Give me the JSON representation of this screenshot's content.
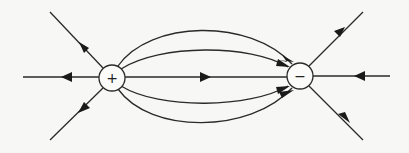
{
  "diagram": {
    "colors": {
      "line": "#2a2a2a",
      "background": "#f7f7f5",
      "charge_fill": "#fbfbfa"
    },
    "charges": [
      {
        "id": "positive",
        "label": "+",
        "cx": 112,
        "cy": 78,
        "r": 13
      },
      {
        "id": "negative",
        "label": "−",
        "cx": 300,
        "cy": 76,
        "r": 13
      }
    ],
    "field_lines": [
      {
        "id": "left-upper",
        "direction": "away-from-positive"
      },
      {
        "id": "left-horizontal",
        "direction": "away-from-positive"
      },
      {
        "id": "left-lower",
        "direction": "away-from-positive"
      },
      {
        "id": "arc-outer-top",
        "direction": "positive-to-negative"
      },
      {
        "id": "arc-inner-top",
        "direction": "positive-to-negative"
      },
      {
        "id": "axis-center",
        "direction": "positive-to-negative"
      },
      {
        "id": "arc-inner-bottom",
        "direction": "positive-to-negative"
      },
      {
        "id": "arc-outer-bottom",
        "direction": "positive-to-negative"
      },
      {
        "id": "right-upper",
        "direction": "toward-negative"
      },
      {
        "id": "right-horizontal",
        "direction": "toward-negative"
      },
      {
        "id": "right-lower",
        "direction": "toward-negative"
      }
    ]
  }
}
